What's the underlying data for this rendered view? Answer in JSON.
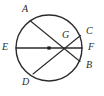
{
  "figure": {
    "kind": "circle-with-chords-diagram",
    "background_color": "#ffffff",
    "stroke_color": "#2b2b2b",
    "label_color": "#2b2b2b",
    "canvas": {
      "width": 104,
      "height": 96
    },
    "circle": {
      "name": "main-circle",
      "cx": 49,
      "cy": 48,
      "r": 33,
      "stroke_width": 1.4,
      "fill": "none"
    },
    "center_dot": {
      "name": "center-point",
      "cx": 49,
      "cy": 48,
      "size": 3.2,
      "color": "#1a1a1a"
    },
    "intersection_point": {
      "name": "G",
      "x": 70,
      "y": 48
    },
    "segments": [
      {
        "name": "chord-ab",
        "from_label": "A",
        "to_label": "B",
        "x1": 30.5,
        "y1": 21.0,
        "x2": 80.0,
        "y2": 61.5,
        "stroke_width": 1.1
      },
      {
        "name": "chord-cd",
        "from_label": "C",
        "to_label": "D",
        "x1": 80.5,
        "y1": 35.5,
        "x2": 33.0,
        "y2": 74.0,
        "stroke_width": 1.1
      },
      {
        "name": "diameter-ef",
        "from_label": "E",
        "to_label": "F",
        "x1": 16.0,
        "y1": 48.0,
        "x2": 82.0,
        "y2": 48.0,
        "stroke_width": 1.6
      }
    ],
    "labels": [
      {
        "name": "point-label-a",
        "text": "A",
        "x": 22,
        "y": 4,
        "anchor": "topleft"
      },
      {
        "name": "point-label-c",
        "text": "C",
        "x": 86,
        "y": 26,
        "anchor": "topleft"
      },
      {
        "name": "point-label-g",
        "text": "G",
        "x": 62,
        "y": 30,
        "anchor": "topleft"
      },
      {
        "name": "point-label-f",
        "text": "F",
        "x": 88,
        "y": 42,
        "anchor": "topleft"
      },
      {
        "name": "point-label-e",
        "text": "E",
        "x": 2,
        "y": 42,
        "anchor": "topleft"
      },
      {
        "name": "point-label-b",
        "text": "B",
        "x": 86,
        "y": 60,
        "anchor": "topleft"
      },
      {
        "name": "point-label-d",
        "text": "D",
        "x": 22,
        "y": 77,
        "anchor": "topleft"
      }
    ]
  }
}
